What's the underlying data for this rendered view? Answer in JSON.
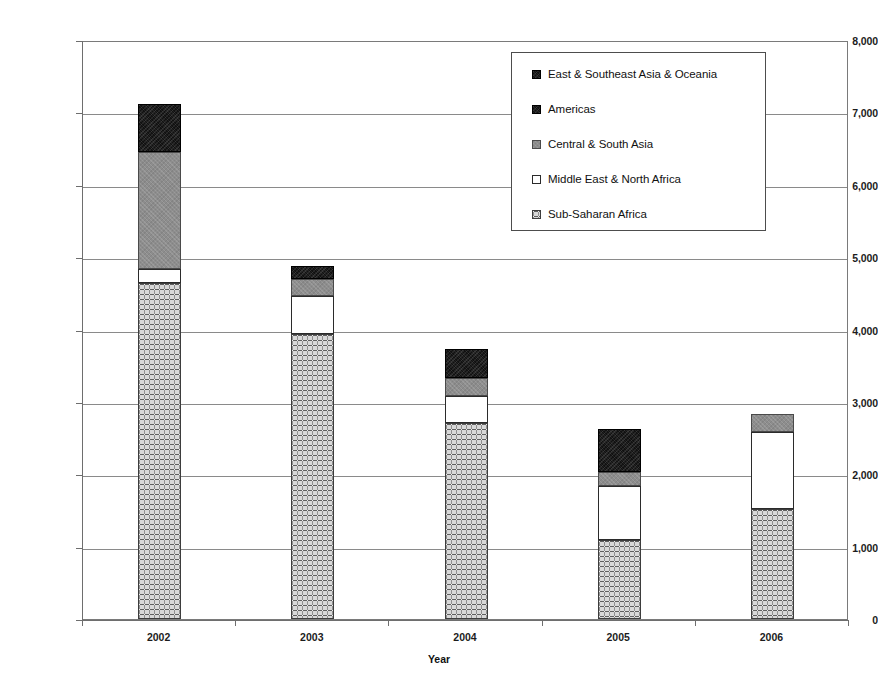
{
  "chart_data": {
    "type": "bar",
    "stacked": true,
    "title": "",
    "xlabel": "Year",
    "ylabel": "Number of Deaths",
    "categories": [
      "2002",
      "2003",
      "2004",
      "2005",
      "2006"
    ],
    "ylim": [
      0,
      8000
    ],
    "ytick_labels": [
      "8,000",
      "7,000",
      "6,000",
      "5,000",
      "4,000",
      "3,000",
      "2,000",
      "1,000",
      "0"
    ],
    "ytick_values": [
      8000,
      7000,
      6000,
      5000,
      4000,
      3000,
      2000,
      1000,
      0
    ],
    "grid": true,
    "legend_position": "top-right",
    "series": [
      {
        "name": "East & Southeast Asia & Oceania",
        "swatch": "black",
        "color": "#111111",
        "values": [
          670,
          180,
          400,
          595,
          0
        ]
      },
      {
        "name": "Americas",
        "swatch": "black",
        "color": "#111111",
        "values": [
          0,
          0,
          0,
          0,
          0
        ]
      },
      {
        "name": "Central & South Asia",
        "swatch": "gray",
        "color": "#8d8d8d",
        "values": [
          1615,
          235,
          250,
          190,
          250
        ]
      },
      {
        "name": "Middle East & North Africa",
        "swatch": "white",
        "color": "#ffffff",
        "values": [
          195,
          525,
          370,
          750,
          1060
        ]
      },
      {
        "name": "Sub-Saharan Africa",
        "swatch": "speckle",
        "color": "#b4b4b4",
        "values": [
          4640,
          3935,
          2710,
          1090,
          1520
        ]
      }
    ],
    "totals": [
      7120,
      4875,
      3730,
      2625,
      2830
    ]
  },
  "legend": {
    "items": [
      {
        "label": "East & Southeast Asia & Oceania",
        "swatch": "black"
      },
      {
        "label": "Americas",
        "swatch": "black"
      },
      {
        "label": "Central & South Asia",
        "swatch": "gray"
      },
      {
        "label": "Middle East & North Africa",
        "swatch": "white"
      },
      {
        "label": "Sub-Saharan Africa",
        "swatch": "speckle"
      }
    ]
  }
}
